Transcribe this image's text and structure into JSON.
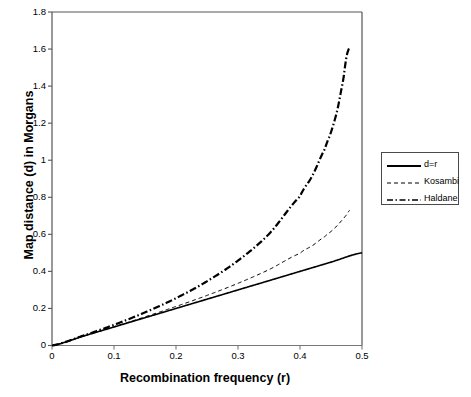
{
  "chart_data": {
    "type": "line",
    "title": "",
    "xlabel": "Recombination frequency (r)",
    "ylabel": "Map distance (d) in Morgans",
    "xlim": [
      0,
      0.5
    ],
    "ylim": [
      0,
      1.8
    ],
    "xticks": [
      "0",
      "0.1",
      "0.2",
      "0.3",
      "0.4",
      "0.5"
    ],
    "xtick_values": [
      0,
      0.1,
      0.2,
      0.3,
      0.4,
      0.5
    ],
    "yticks": [
      "0",
      "0.2",
      "0.4",
      "0.6",
      "0.8",
      "1",
      "1.2",
      "1.4",
      "1.6",
      "1.8"
    ],
    "ytick_values": [
      0,
      0.2,
      0.4,
      0.6,
      0.8,
      1.0,
      1.2,
      1.4,
      1.6,
      1.8
    ],
    "grid": false,
    "legend_position": "right",
    "series": [
      {
        "name": "d=r",
        "style": "solid",
        "color": "#000000",
        "width": 1.6,
        "x": [
          0,
          0.05,
          0.1,
          0.15,
          0.2,
          0.25,
          0.3,
          0.35,
          0.4,
          0.45,
          0.5
        ],
        "values": [
          0,
          0.05,
          0.1,
          0.15,
          0.2,
          0.25,
          0.3,
          0.35,
          0.4,
          0.45,
          0.5
        ]
      },
      {
        "name": "Kosambi",
        "style": "dashed",
        "color": "#000000",
        "width": 1.0,
        "x": [
          0,
          0.05,
          0.1,
          0.15,
          0.2,
          0.25,
          0.3,
          0.35,
          0.4,
          0.42,
          0.44,
          0.45,
          0.46,
          0.47,
          0.475,
          0.48
        ],
        "values": [
          0,
          0.0502,
          0.1014,
          0.1546,
          0.2107,
          0.2703,
          0.3356,
          0.4096,
          0.4973,
          0.5391,
          0.5875,
          0.6154,
          0.647,
          0.6838,
          0.7051,
          0.7296
        ]
      },
      {
        "name": "Haldane",
        "style": "dashdot",
        "color": "#000000",
        "width": 2.2,
        "x": [
          0,
          0.05,
          0.1,
          0.15,
          0.2,
          0.25,
          0.3,
          0.35,
          0.4,
          0.42,
          0.44,
          0.45,
          0.46,
          0.47,
          0.475,
          0.48
        ],
        "values": [
          0,
          0.0527,
          0.1116,
          0.1783,
          0.2554,
          0.3466,
          0.4581,
          0.602,
          0.8047,
          0.9163,
          1.0601,
          1.1513,
          1.2685,
          1.4351,
          1.5581,
          1.6094
        ]
      }
    ]
  },
  "legend": {
    "items": [
      {
        "label": "d=r",
        "style": "solid"
      },
      {
        "label": "Kosambi",
        "style": "dashed"
      },
      {
        "label": "Haldane",
        "style": "dashdot"
      }
    ]
  }
}
